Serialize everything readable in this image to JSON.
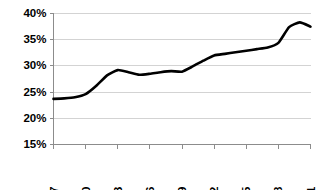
{
  "chart_data": {
    "type": "line",
    "title": "",
    "subtitle": "",
    "xlabel": "",
    "ylabel": "",
    "grid": true,
    "legend": false,
    "legend_position": "none",
    "line_color": "#000000",
    "gridline_color": "#c8c8c8",
    "axis_color": "#8c8c8c",
    "background_color": "#ffffff",
    "xlim": [
      1987,
      2011
    ],
    "ylim": [
      15,
      40
    ],
    "ytick_values": [
      40,
      35,
      30,
      25,
      20,
      15
    ],
    "ytick_labels": [
      "40%",
      "35%",
      "30%",
      "25%",
      "20%",
      "15%"
    ],
    "xtick_values": [
      1987,
      1990,
      1993,
      1996,
      1999,
      2002,
      2005,
      2008,
      2011
    ],
    "xtick_labels": [
      "1987",
      "1990",
      "1993",
      "1996",
      "1999",
      "2002",
      "2005",
      "2008",
      "2011"
    ],
    "xtick_label_rotation": -90,
    "series": [
      {
        "name": "series-1",
        "x": [
          1987,
          1988,
          1989,
          1990,
          1991,
          1992,
          1993,
          1994,
          1995,
          1996,
          1997,
          1998,
          1999,
          2000,
          2001,
          2002,
          2003,
          2004,
          2005,
          2006,
          2007,
          2008,
          2009,
          2010,
          2011
        ],
        "values": [
          23.7,
          23.8,
          24.0,
          24.6,
          26.2,
          28.2,
          29.2,
          28.8,
          28.3,
          28.5,
          28.8,
          29.0,
          28.9,
          29.9,
          31.0,
          32.0,
          32.3,
          32.6,
          32.9,
          33.2,
          33.5,
          34.4,
          37.4,
          38.3,
          37.5
        ]
      }
    ]
  }
}
